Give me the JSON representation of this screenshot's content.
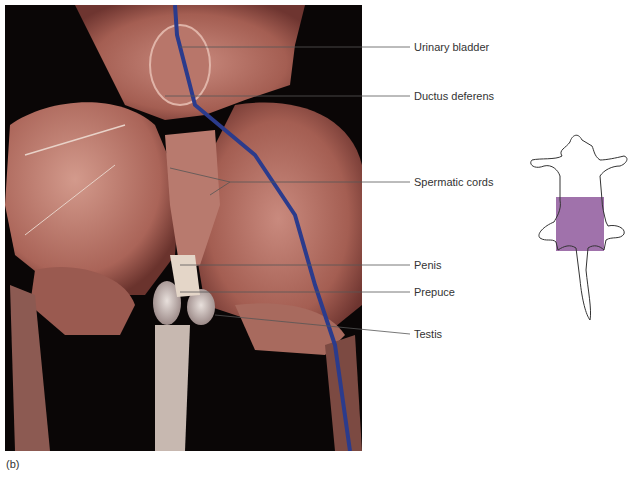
{
  "figure": {
    "panel_letter": "(b)",
    "photo_description": "Dissection photograph of male reproductive region (ventral view) showing muscles, blue-injected vein and structures",
    "labels": [
      {
        "id": "urinary-bladder",
        "text": "Urinary bladder",
        "y": 47
      },
      {
        "id": "ductus-deferens",
        "text": "Ductus deferens",
        "y": 96
      },
      {
        "id": "spermatic-cords",
        "text": "Spermatic cords",
        "y": 182
      },
      {
        "id": "penis",
        "text": "Penis",
        "y": 265
      },
      {
        "id": "prepuce",
        "text": "Prepuce",
        "y": 292
      },
      {
        "id": "testis",
        "text": "Testis",
        "y": 334
      }
    ],
    "orientation_inset": {
      "description": "Outline of animal body with highlighted region",
      "highlight_color": "#a072ab"
    }
  }
}
